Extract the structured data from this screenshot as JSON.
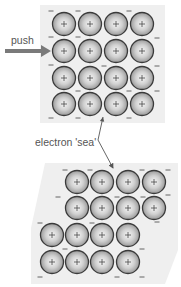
{
  "labels": {
    "push": "push",
    "electron_sea": "electron 'sea'"
  },
  "colors": {
    "panel_fill": "#efefef",
    "ion_edge": "#3a3a3a",
    "ion_center": "#f7f7f7",
    "ion_outer": "#9a9a9a",
    "plus": "#444444",
    "minus": "#555555",
    "push_arrow": "#7a7a7a",
    "pointer_line": "#555555"
  },
  "symbols": {
    "ion_charge": "+",
    "electron_charge": "−"
  },
  "top_lattice": {
    "panel": [
      [
        40,
        5
      ],
      [
        165,
        5
      ],
      [
        165,
        123
      ],
      [
        40,
        123
      ]
    ],
    "ion_radius": 11.5,
    "ions": [
      [
        64,
        24
      ],
      [
        90,
        24
      ],
      [
        116,
        24
      ],
      [
        142,
        24
      ],
      [
        64,
        51
      ],
      [
        90,
        51
      ],
      [
        116,
        51
      ],
      [
        142,
        51
      ],
      [
        64,
        78
      ],
      [
        90,
        78
      ],
      [
        116,
        78
      ],
      [
        142,
        78
      ],
      [
        64,
        104
      ],
      [
        90,
        104
      ],
      [
        116,
        104
      ],
      [
        142,
        104
      ]
    ],
    "electrons": [
      [
        51,
        11
      ],
      [
        78,
        11
      ],
      [
        129,
        11
      ],
      [
        51,
        37
      ],
      [
        78,
        37
      ],
      [
        157,
        38
      ],
      [
        51,
        65
      ],
      [
        104,
        66
      ],
      [
        157,
        66
      ],
      [
        78,
        91
      ],
      [
        129,
        91
      ],
      [
        157,
        91
      ],
      [
        51,
        118
      ],
      [
        78,
        118
      ],
      [
        129,
        118
      ]
    ]
  },
  "bottom_lattice": {
    "panel": [
      [
        45,
        163
      ],
      [
        178,
        163
      ],
      [
        178,
        250
      ],
      [
        165,
        284
      ],
      [
        31,
        284
      ],
      [
        31,
        228
      ]
    ],
    "ion_radius": 11.5,
    "ions": [
      [
        77,
        182
      ],
      [
        102,
        182
      ],
      [
        128,
        182
      ],
      [
        154,
        182
      ],
      [
        77,
        208
      ],
      [
        102,
        208
      ],
      [
        128,
        208
      ],
      [
        154,
        208
      ],
      [
        52,
        235
      ],
      [
        77,
        235
      ],
      [
        102,
        235
      ],
      [
        128,
        235
      ],
      [
        52,
        262
      ],
      [
        77,
        262
      ],
      [
        102,
        262
      ],
      [
        128,
        262
      ]
    ],
    "electrons": [
      [
        65,
        170
      ],
      [
        90,
        170
      ],
      [
        142,
        170
      ],
      [
        168,
        170
      ],
      [
        58,
        197
      ],
      [
        117,
        197
      ],
      [
        143,
        197
      ],
      [
        168,
        195
      ],
      [
        40,
        223
      ],
      [
        92,
        223
      ],
      [
        157,
        222
      ],
      [
        65,
        249
      ],
      [
        142,
        249
      ],
      [
        40,
        277
      ],
      [
        117,
        277
      ],
      [
        142,
        277
      ]
    ]
  },
  "push_arrow": {
    "x1": 5,
    "y1": 51,
    "x2": 51,
    "y2": 51
  },
  "pointer": {
    "points": [
      [
        103,
        117
      ],
      [
        98,
        140
      ],
      [
        113,
        168
      ]
    ],
    "label_pos": [
      35,
      141
    ]
  }
}
